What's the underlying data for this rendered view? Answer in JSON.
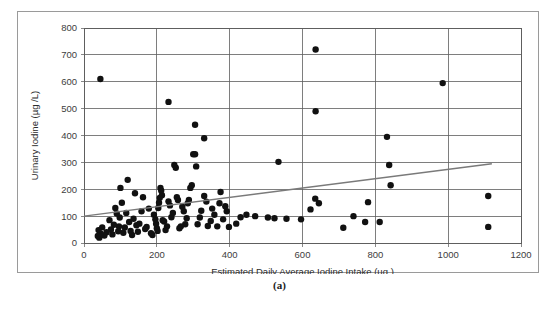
{
  "figure": {
    "caption": "(a)"
  },
  "chart_data": {
    "type": "scatter",
    "title": "",
    "xlabel": "Estimated Daily Average Iodine Intake (µg )",
    "ylabel": "Urinary Iodine (µg /L)",
    "xlim": [
      0,
      1200
    ],
    "ylim": [
      0,
      800
    ],
    "xticks": [
      0,
      200,
      400,
      600,
      800,
      1000,
      1200
    ],
    "yticks": [
      0,
      100,
      200,
      300,
      400,
      500,
      600,
      700,
      800
    ],
    "xtick_labels": [
      "0",
      "200",
      "400",
      "600",
      "800",
      "1000",
      "1200"
    ],
    "ytick_labels": [
      "0",
      "100",
      "200",
      "300",
      "400",
      "500",
      "600",
      "700",
      "800"
    ],
    "grid": true,
    "grid_axes": "both",
    "grid_x_step": 200,
    "grid_y_step": 100,
    "legend": false,
    "marker": "filled-circle",
    "marker_color": "#111111",
    "marker_size_px": 3.2,
    "series": [
      {
        "name": "Participants",
        "points": [
          [
            45,
            610
          ],
          [
            232,
            525
          ],
          [
            305,
            440
          ],
          [
            330,
            390
          ],
          [
            636,
            720
          ],
          [
            636,
            490
          ],
          [
            985,
            595
          ],
          [
            832,
            395
          ],
          [
            838,
            290
          ],
          [
            534,
            302
          ],
          [
            1110,
            175
          ],
          [
            1110,
            60
          ],
          [
            842,
            215
          ],
          [
            772,
            78
          ],
          [
            712,
            57
          ],
          [
            740,
            100
          ],
          [
            812,
            78
          ],
          [
            622,
            125
          ],
          [
            635,
            165
          ],
          [
            645,
            148
          ],
          [
            780,
            152
          ],
          [
            596,
            88
          ],
          [
            556,
            90
          ],
          [
            523,
            92
          ],
          [
            505,
            95
          ],
          [
            470,
            100
          ],
          [
            446,
            105
          ],
          [
            430,
            96
          ],
          [
            418,
            72
          ],
          [
            398,
            60
          ],
          [
            392,
            118
          ],
          [
            388,
            137
          ],
          [
            382,
            88
          ],
          [
            375,
            190
          ],
          [
            372,
            148
          ],
          [
            366,
            62
          ],
          [
            358,
            105
          ],
          [
            352,
            128
          ],
          [
            348,
            82
          ],
          [
            340,
            63
          ],
          [
            336,
            154
          ],
          [
            330,
            175
          ],
          [
            322,
            120
          ],
          [
            318,
            95
          ],
          [
            312,
            70
          ],
          [
            308,
            285
          ],
          [
            305,
            330
          ],
          [
            300,
            330
          ],
          [
            296,
            215
          ],
          [
            292,
            205
          ],
          [
            288,
            160
          ],
          [
            285,
            148
          ],
          [
            282,
            92
          ],
          [
            278,
            70
          ],
          [
            274,
            118
          ],
          [
            270,
            135
          ],
          [
            266,
            62
          ],
          [
            262,
            55
          ],
          [
            258,
            160
          ],
          [
            255,
            170
          ],
          [
            252,
            280
          ],
          [
            248,
            290
          ],
          [
            244,
            112
          ],
          [
            240,
            96
          ],
          [
            236,
            140
          ],
          [
            232,
            155
          ],
          [
            228,
            62
          ],
          [
            224,
            48
          ],
          [
            220,
            80
          ],
          [
            216,
            85
          ],
          [
            214,
            178
          ],
          [
            212,
            195
          ],
          [
            210,
            205
          ],
          [
            208,
            168
          ],
          [
            206,
            150
          ],
          [
            204,
            130
          ],
          [
            202,
            45
          ],
          [
            200,
            55
          ],
          [
            198,
            72
          ],
          [
            196,
            88
          ],
          [
            192,
            105
          ],
          [
            188,
            30
          ],
          [
            184,
            36
          ],
          [
            178,
            128
          ],
          [
            172,
            60
          ],
          [
            168,
            52
          ],
          [
            162,
            170
          ],
          [
            158,
            118
          ],
          [
            152,
            72
          ],
          [
            148,
            42
          ],
          [
            144,
            66
          ],
          [
            140,
            185
          ],
          [
            136,
            90
          ],
          [
            132,
            30
          ],
          [
            128,
            45
          ],
          [
            124,
            78
          ],
          [
            120,
            235
          ],
          [
            116,
            112
          ],
          [
            112,
            58
          ],
          [
            108,
            38
          ],
          [
            104,
            150
          ],
          [
            100,
            205
          ],
          [
            98,
            95
          ],
          [
            96,
            62
          ],
          [
            94,
            44
          ],
          [
            90,
            110
          ],
          [
            86,
            130
          ],
          [
            82,
            68
          ],
          [
            78,
            32
          ],
          [
            74,
            50
          ],
          [
            70,
            85
          ],
          [
            62,
            40
          ],
          [
            56,
            28
          ],
          [
            50,
            58
          ],
          [
            46,
            35
          ],
          [
            42,
            20
          ],
          [
            40,
            48
          ],
          [
            38,
            26
          ]
        ]
      }
    ],
    "trendline": {
      "type": "linear",
      "x_start": 0,
      "y_start": 100,
      "x_end": 1120,
      "y_end": 295,
      "color": "#7a7a7a"
    }
  }
}
